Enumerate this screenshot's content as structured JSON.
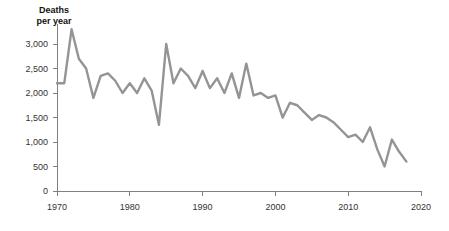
{
  "chart_data": {
    "type": "line",
    "title": "Deaths per year",
    "ylabel": "Deaths per year",
    "xlabel": "",
    "xlim": [
      1969,
      2020
    ],
    "ylim": [
      0,
      3400
    ],
    "grid": false,
    "legend": "none",
    "line_color": "#949494",
    "axis_color": "#808080",
    "y_ticks": [
      0,
      500,
      1000,
      1500,
      2000,
      2500,
      3000
    ],
    "y_tick_labels": [
      "0",
      "500",
      "1,000",
      "1,500",
      "2,000",
      "2,500",
      "3,000"
    ],
    "x_ticks": [
      1970,
      1980,
      1990,
      2000,
      2010,
      2020
    ],
    "x_tick_labels": [
      "1970",
      "1980",
      "1990",
      "2000",
      "2010",
      "2020"
    ],
    "x": [
      1970,
      1971,
      1972,
      1973,
      1974,
      1975,
      1976,
      1977,
      1978,
      1979,
      1980,
      1981,
      1982,
      1983,
      1984,
      1985,
      1986,
      1987,
      1988,
      1989,
      1990,
      1991,
      1992,
      1993,
      1994,
      1995,
      1996,
      1997,
      1998,
      1999,
      2000,
      2001,
      2002,
      2003,
      2004,
      2005,
      2006,
      2007,
      2008,
      2009,
      2010,
      2011,
      2012,
      2013,
      2014,
      2015,
      2016,
      2017,
      2018
    ],
    "values": [
      2200,
      2200,
      3300,
      2700,
      2500,
      1900,
      2350,
      2400,
      2250,
      2000,
      2200,
      2000,
      2300,
      2050,
      1350,
      3000,
      2200,
      2500,
      2350,
      2100,
      2450,
      2100,
      2300,
      2000,
      2400,
      1900,
      2600,
      1950,
      2000,
      1900,
      1950,
      1500,
      1800,
      1750,
      1600,
      1450,
      1550,
      1500,
      1400,
      1250,
      1100,
      1150,
      1000,
      1300,
      850,
      500,
      1050,
      800,
      600
    ]
  },
  "axis_title_text": "Deaths\nper year"
}
